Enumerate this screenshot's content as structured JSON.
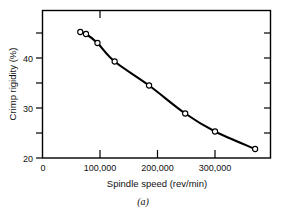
{
  "figure": {
    "caption": "(a)",
    "background_color": "#ffffff",
    "ink_color": "#000000"
  },
  "chart_data": {
    "type": "line",
    "title": "",
    "xlabel": "Spindle speed  (rev/min)",
    "ylabel": "Crimp rigidity (%)",
    "xlim": [
      0,
      400000
    ],
    "ylim": [
      20,
      46
    ],
    "grid": false,
    "legend": null,
    "marker": "open-circle",
    "x": [
      65000,
      75000,
      95000,
      125000,
      185000,
      248000,
      300000,
      370000
    ],
    "y": [
      45.2,
      44.8,
      43.0,
      39.3,
      34.5,
      28.9,
      25.3,
      21.8
    ],
    "series": [
      {
        "name": "Crimp rigidity",
        "values": [
          45.2,
          44.8,
          43.0,
          39.3,
          34.5,
          28.9,
          25.3,
          21.8
        ]
      }
    ],
    "xticks": [
      0,
      100000,
      200000,
      300000
    ],
    "xtick_labels": [
      "0",
      "100,000",
      "200,000",
      "300,000"
    ],
    "yticks": [
      20,
      25,
      30,
      35,
      40,
      45
    ],
    "ytick_labels": [
      "20",
      "",
      "30",
      "",
      "40",
      ""
    ],
    "ytick_major_labels": [
      "20",
      "30",
      "40"
    ],
    "ytick_minor_values": [
      25,
      35,
      45
    ]
  }
}
